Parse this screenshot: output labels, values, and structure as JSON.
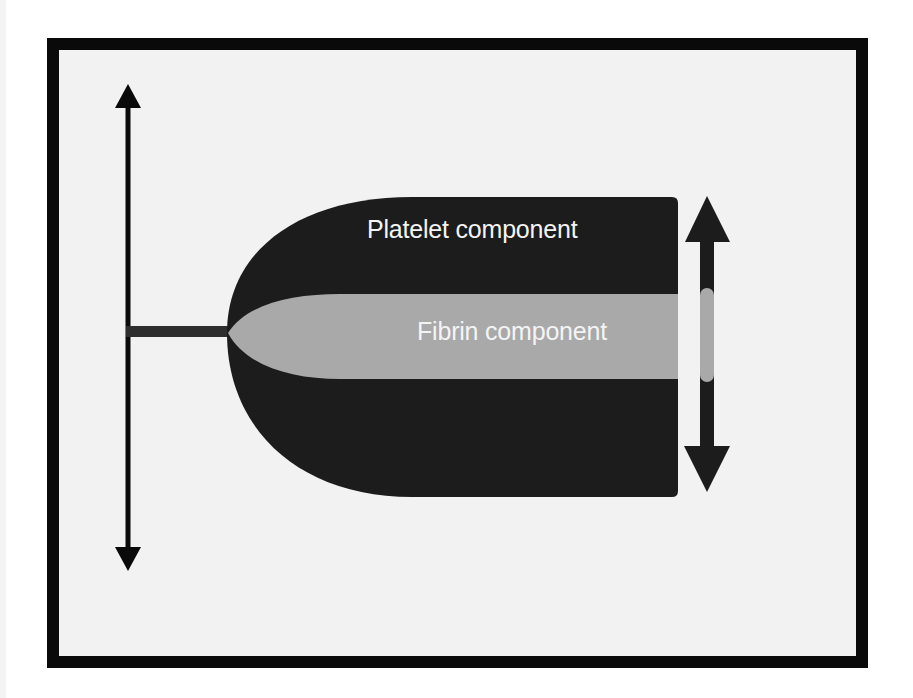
{
  "diagram": {
    "type": "schematic",
    "labels": {
      "platelet": "Platelet component",
      "fibrin": "Fibrin component"
    },
    "colors": {
      "frame": "#0a0a0a",
      "background": "#f2f2f2",
      "platelet": "#1c1c1c",
      "fibrin": "#a9a9a9",
      "stalk": "#2e2e2e",
      "label_text": "#f4f4f4"
    },
    "elements": [
      {
        "name": "vertical-double-arrow-left",
        "x": 128,
        "y_top": 84,
        "y_bottom": 571
      },
      {
        "name": "stalk",
        "x_start": 126,
        "x_end": 230,
        "y": 331
      },
      {
        "name": "thrombus-body",
        "x_start": 227,
        "x_end": 678,
        "y_top": 197,
        "y_bottom": 497
      },
      {
        "name": "fibrin-core",
        "x_start": 228,
        "x_end": 678,
        "y_top": 294,
        "y_bottom": 379
      },
      {
        "name": "vertical-double-arrow-right",
        "x": 707,
        "y_top": 196,
        "y_bottom": 492
      }
    ]
  }
}
